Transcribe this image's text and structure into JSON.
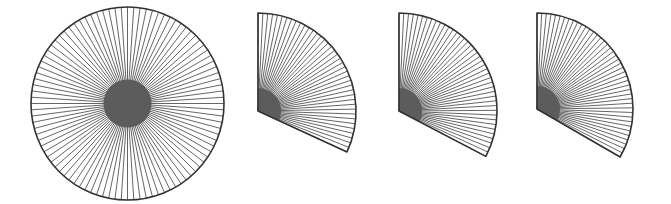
{
  "colors": {
    "background": "#ffffff",
    "spoke": "#555555",
    "outline": "#333333",
    "hub": "#5c5c5c"
  },
  "figures": [
    {
      "name": "full-circle-wheel",
      "type": "circle",
      "cx": 127.5,
      "cy": 103.5,
      "r": 96.5,
      "hub_r": 24,
      "spokes": 96
    },
    {
      "name": "fan-1",
      "type": "fan",
      "cx": 258,
      "cy": 111,
      "r": 98,
      "hub_r": 23,
      "start_deg": -90,
      "end_deg": 24.7,
      "spokes": 40
    },
    {
      "name": "fan-2",
      "type": "fan",
      "cx": 399,
      "cy": 111,
      "r": 98,
      "hub_r": 23,
      "start_deg": -90,
      "end_deg": 27.6,
      "spokes": 42
    },
    {
      "name": "fan-3",
      "type": "fan",
      "cx": 537,
      "cy": 109,
      "r": 96,
      "hub_r": 23,
      "start_deg": -90,
      "end_deg": 30,
      "spokes": 43
    }
  ]
}
